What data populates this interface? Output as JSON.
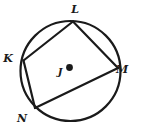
{
  "figure": {
    "background_color": "#ffffff",
    "stroke_color": "#1a1a1a",
    "circle": {
      "name": "circle-j",
      "center_label": "J",
      "cx": 70.5,
      "cy": 71,
      "r": 50,
      "stroke_width": 2.2
    },
    "center_point": {
      "label": "J",
      "dot_x": 69.5,
      "dot_y": 67.5,
      "dot_r": 3.4,
      "label_x": 60,
      "label_y": 75
    },
    "vertices": [
      {
        "label": "K",
        "x": 23.5,
        "y": 60.5,
        "label_x": 8,
        "label_y": 62
      },
      {
        "label": "L",
        "x": 73.0,
        "y": 21.5,
        "label_x": 75,
        "label_y": 13
      },
      {
        "label": "M",
        "x": 118.0,
        "y": 68.0,
        "label_x": 122,
        "label_y": 73
      },
      {
        "label": "N",
        "x": 35.0,
        "y": 108.0,
        "label_x": 22,
        "label_y": 122
      }
    ],
    "sides": [
      {
        "name": "side-KL",
        "from": "K",
        "to": "L"
      },
      {
        "name": "side-LM",
        "from": "L",
        "to": "M"
      },
      {
        "name": "side-MN",
        "from": "M",
        "to": "N"
      },
      {
        "name": "side-NK",
        "from": "N",
        "to": "K"
      }
    ],
    "stroke_width_chord": 2.2
  }
}
